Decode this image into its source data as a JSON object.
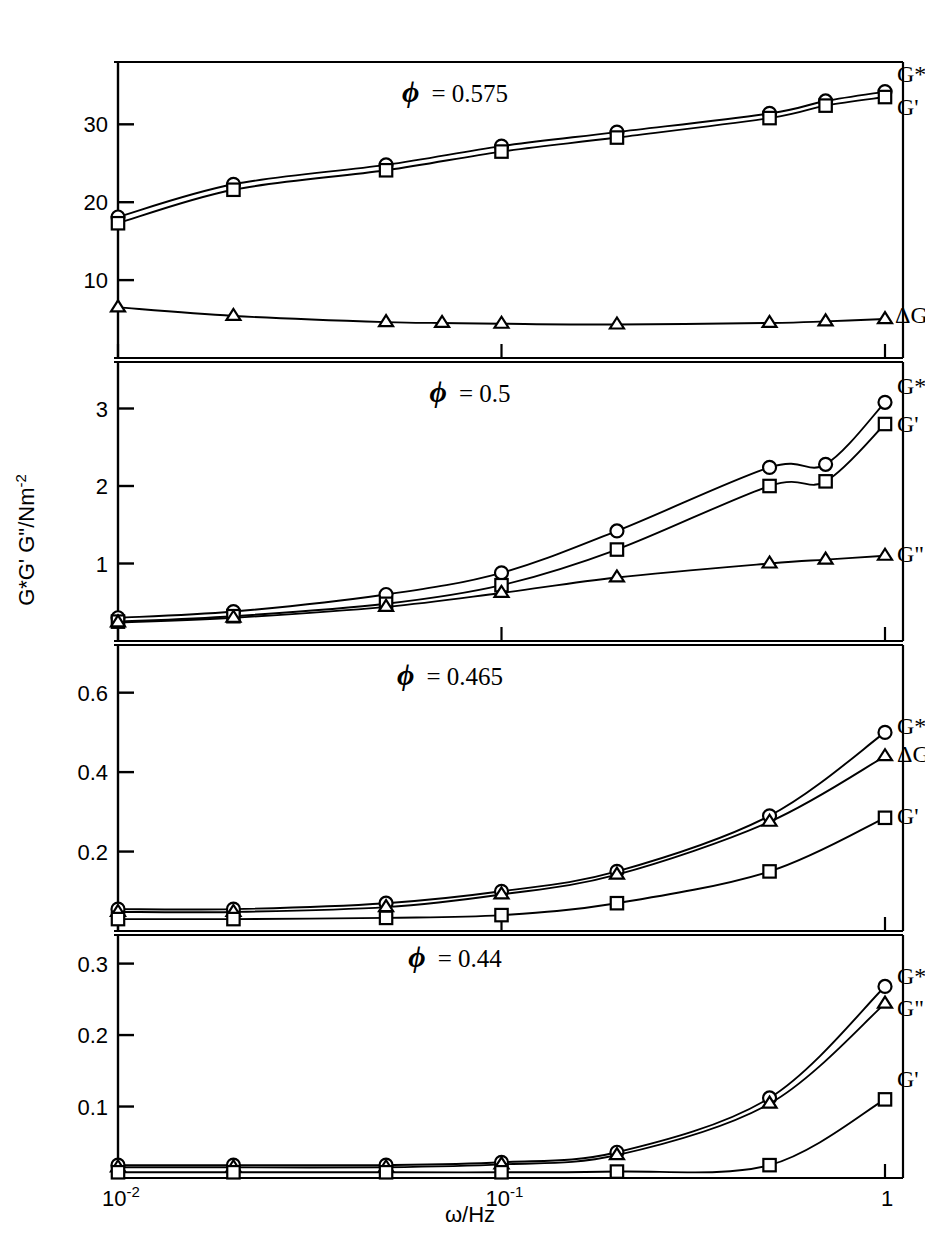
{
  "figure": {
    "axis_label_y": "G*G' G\"/Nm",
    "axis_label_y_sup": "-2",
    "axis_label_x": "ω/Hz",
    "x_ticks": [
      {
        "mantissa": "10",
        "exp": "-2",
        "value": 0.01
      },
      {
        "mantissa": "10",
        "exp": "-1",
        "value": 0.1
      },
      {
        "mantissa": "1",
        "exp": "",
        "value": 1.0
      }
    ],
    "marker_shapes": {
      "G*": "circle",
      "G'": "square",
      "G\"": "triangle"
    },
    "ink_color": "#000000",
    "background_color": "#ffffff"
  },
  "chart_data": [
    {
      "type": "line",
      "title": "ϕ = 0.575",
      "phi": 0.575,
      "xlabel": "ω/Hz",
      "ylabel": "G*G' G\"/Nm-2",
      "xscale": "log",
      "xlim": [
        0.01,
        1.0
      ],
      "ylim": [
        0,
        38
      ],
      "yticks": [
        10,
        20,
        30
      ],
      "ytick_labels": [
        "10",
        "20",
        "30"
      ],
      "grid": false,
      "legend_position": "right-inline",
      "series": [
        {
          "name": "G*",
          "marker": "circle",
          "label": "G*",
          "x": [
            0.01,
            0.02,
            0.05,
            0.1,
            0.2,
            0.5,
            0.7,
            1.0
          ],
          "y": [
            18.1,
            22.3,
            24.8,
            27.2,
            29.0,
            31.4,
            33.0,
            34.2
          ]
        },
        {
          "name": "G'",
          "marker": "square",
          "label": "G'",
          "x": [
            0.01,
            0.02,
            0.05,
            0.1,
            0.2,
            0.5,
            0.7,
            1.0
          ],
          "y": [
            17.3,
            21.6,
            24.1,
            26.5,
            28.3,
            30.8,
            32.4,
            33.5
          ]
        },
        {
          "name": "G\"",
          "marker": "triangle",
          "label": "ΔG\"",
          "x": [
            0.01,
            0.02,
            0.05,
            0.07,
            0.1,
            0.2,
            0.5,
            0.7,
            1.0
          ],
          "y": [
            6.5,
            5.4,
            4.6,
            4.5,
            4.4,
            4.3,
            4.5,
            4.7,
            5.0
          ]
        }
      ]
    },
    {
      "type": "line",
      "title": "ϕ = 0.5",
      "phi": 0.5,
      "xlabel": "ω/Hz",
      "ylabel": "G*G' G\"/Nm-2",
      "xscale": "log",
      "xlim": [
        0.01,
        1.0
      ],
      "ylim": [
        0,
        3.6
      ],
      "yticks": [
        1,
        2,
        3
      ],
      "ytick_labels": [
        "1",
        "2",
        "3"
      ],
      "grid": false,
      "legend_position": "right-inline",
      "series": [
        {
          "name": "G*",
          "marker": "circle",
          "label": "G*",
          "x": [
            0.01,
            0.02,
            0.05,
            0.1,
            0.2,
            0.5,
            0.7,
            1.0
          ],
          "y": [
            0.3,
            0.38,
            0.6,
            0.88,
            1.42,
            2.24,
            2.28,
            3.08
          ]
        },
        {
          "name": "G'",
          "marker": "square",
          "label": "G'",
          "x": [
            0.01,
            0.02,
            0.05,
            0.1,
            0.2,
            0.5,
            0.7,
            1.0
          ],
          "y": [
            0.25,
            0.32,
            0.48,
            0.72,
            1.18,
            2.0,
            2.06,
            2.8
          ]
        },
        {
          "name": "G\"",
          "marker": "triangle",
          "label": "G\"",
          "x": [
            0.01,
            0.02,
            0.05,
            0.1,
            0.2,
            0.5,
            0.7,
            1.0
          ],
          "y": [
            0.24,
            0.3,
            0.44,
            0.62,
            0.82,
            1.0,
            1.05,
            1.1
          ]
        }
      ]
    },
    {
      "type": "line",
      "title": "ϕ = 0.465",
      "phi": 0.465,
      "xlabel": "ω/Hz",
      "ylabel": "G*G' G\"/Nm-2",
      "xscale": "log",
      "xlim": [
        0.01,
        1.0
      ],
      "ylim": [
        0,
        0.72
      ],
      "yticks": [
        0.2,
        0.4,
        0.6
      ],
      "ytick_labels": [
        "0.2",
        "0.4",
        "0.6"
      ],
      "grid": false,
      "legend_position": "right-inline",
      "series": [
        {
          "name": "G*",
          "marker": "circle",
          "label": "G*",
          "x": [
            0.01,
            0.02,
            0.05,
            0.1,
            0.2,
            0.5,
            1.0
          ],
          "y": [
            0.055,
            0.055,
            0.07,
            0.1,
            0.15,
            0.29,
            0.5
          ]
        },
        {
          "name": "G\"",
          "marker": "triangle",
          "label": "ΔG\"",
          "x": [
            0.01,
            0.02,
            0.05,
            0.1,
            0.2,
            0.5,
            1.0
          ],
          "y": [
            0.048,
            0.048,
            0.06,
            0.092,
            0.142,
            0.275,
            0.44
          ]
        },
        {
          "name": "G'",
          "marker": "square",
          "label": "G'",
          "x": [
            0.01,
            0.02,
            0.05,
            0.1,
            0.2,
            0.5,
            1.0
          ],
          "y": [
            0.03,
            0.03,
            0.033,
            0.04,
            0.07,
            0.15,
            0.285
          ]
        }
      ]
    },
    {
      "type": "line",
      "title": "ϕ = 0.44",
      "phi": 0.44,
      "xlabel": "ω/Hz",
      "ylabel": "G*G' G\"/Nm-2",
      "xscale": "log",
      "xlim": [
        0.01,
        1.0
      ],
      "ylim": [
        0,
        0.34
      ],
      "yticks": [
        0.1,
        0.2,
        0.3
      ],
      "ytick_labels": [
        "0.1",
        "0.2",
        "0.3"
      ],
      "grid": false,
      "legend_position": "right-inline",
      "series": [
        {
          "name": "G*",
          "marker": "circle",
          "label": "G*",
          "x": [
            0.01,
            0.02,
            0.05,
            0.1,
            0.2,
            0.5,
            1.0
          ],
          "y": [
            0.018,
            0.018,
            0.018,
            0.022,
            0.036,
            0.112,
            0.268
          ]
        },
        {
          "name": "G\"",
          "marker": "triangle",
          "label": "G\"",
          "x": [
            0.01,
            0.02,
            0.05,
            0.1,
            0.2,
            0.5,
            1.0
          ],
          "y": [
            0.015,
            0.015,
            0.015,
            0.019,
            0.032,
            0.104,
            0.244
          ]
        },
        {
          "name": "G'",
          "marker": "square",
          "label": "G'",
          "x": [
            0.01,
            0.02,
            0.05,
            0.1,
            0.2,
            0.5,
            1.0
          ],
          "y": [
            0.008,
            0.008,
            0.008,
            0.008,
            0.009,
            0.018,
            0.11
          ]
        }
      ]
    }
  ]
}
